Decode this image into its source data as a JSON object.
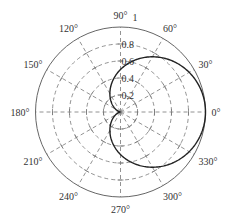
{
  "chart_data": {
    "type": "line",
    "subtype": "polar",
    "title": "",
    "series": [
      {
        "name": "r = (1 + cos θ) / 2",
        "equation": "r = (1+cos(theta))/2",
        "theta_deg": [
          0,
          30,
          60,
          90,
          120,
          150,
          180,
          210,
          240,
          270,
          300,
          330,
          360
        ],
        "r": [
          1.0,
          0.933,
          0.75,
          0.5,
          0.25,
          0.067,
          0.0,
          0.067,
          0.25,
          0.5,
          0.75,
          0.933,
          1.0
        ]
      }
    ],
    "radial_ticks": [
      0.2,
      0.4,
      0.6,
      0.8,
      1
    ],
    "radial_tick_labels": [
      "0.2",
      "0.4",
      "0.6",
      "0.8",
      "1"
    ],
    "angular_ticks_deg": [
      0,
      30,
      60,
      90,
      120,
      150,
      180,
      210,
      240,
      270,
      300,
      330
    ],
    "angular_tick_labels": [
      "0°",
      "30°",
      "60°",
      "90°",
      "120°",
      "150°",
      "180°",
      "210°",
      "240°",
      "270°",
      "300°",
      "330°"
    ],
    "rlim": [
      0,
      1
    ],
    "grid": true,
    "legend": "none"
  },
  "style": {
    "curve_color": "#222222",
    "grid_color": "#777777",
    "outer_circle_color": "#666666",
    "text_color": "#333333"
  }
}
